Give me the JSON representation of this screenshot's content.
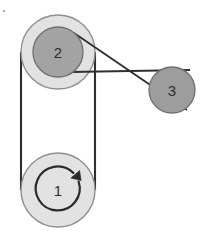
{
  "diagram": {
    "background_color": "#ffffff",
    "line_color": "#2f2f2f",
    "label_color": "#2e2e2e",
    "colors": {
      "pulley_light": "#e2e2e2",
      "pulley_mid": "#a3a3a3",
      "pulley_dark": "#9d9d9d",
      "stroke": "#707070",
      "belt": "#2f2f2f"
    },
    "pulleys": [
      {
        "id": "pulley-1",
        "label": "1",
        "cx": 58,
        "cy": 190,
        "radius": 37,
        "fill": "#e2e2e2",
        "stroke": "#8f8f8f",
        "has_rotation_arrow": true,
        "rotation_direction": "clockwise"
      },
      {
        "id": "pulley-2",
        "label": "2",
        "cx": 58,
        "cy": 52,
        "radius_outer": 37,
        "radius_inner": 25,
        "fill_outer": "#e2e2e2",
        "fill_inner": "#a3a3a3",
        "stroke": "#8f8f8f"
      },
      {
        "id": "pulley-3",
        "label": "3",
        "cx": 172,
        "cy": 90,
        "radius": 23,
        "fill": "#9d9d9d",
        "stroke": "#6f6f6f"
      }
    ],
    "belts": [
      {
        "id": "belt-open-1-2",
        "type": "open",
        "connects": [
          "pulley-1",
          "pulley-2"
        ],
        "segments": [
          {
            "x1": 21,
            "y1": 52,
            "x2": 21,
            "y2": 190
          },
          {
            "x1": 95,
            "y1": 52,
            "x2": 95,
            "y2": 190
          }
        ]
      },
      {
        "id": "belt-crossed-2-3",
        "type": "crossed",
        "connects": [
          "pulley-2",
          "pulley-3"
        ],
        "segments": [
          {
            "x1": 74,
            "y1": 33,
            "x2": 187,
            "y2": 110
          },
          {
            "x1": 70,
            "y1": 72,
            "x2": 190,
            "y2": 70
          }
        ]
      }
    ],
    "rotation_arrow": {
      "cx": 58,
      "cy": 188,
      "radius": 22,
      "stroke": "#2b2b2b",
      "direction_label": "clockwise"
    },
    "artifact_speck": {
      "x": 3,
      "y": 10
    }
  }
}
